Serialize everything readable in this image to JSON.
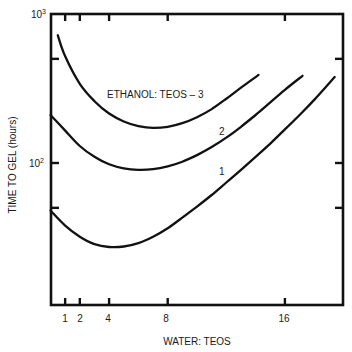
{
  "chart_data": {
    "type": "line",
    "title": "",
    "xlabel": "WATER: TEOS",
    "ylabel": "TIME TO GEL (hours)",
    "xscale": "linear",
    "yscale": "log",
    "xlim": [
      0,
      20
    ],
    "ylim": [
      11,
      1000
    ],
    "x_ticks": [
      1,
      2,
      4,
      8,
      16
    ],
    "x_tick_labels": [
      "1",
      "2",
      "4",
      "8",
      "16"
    ],
    "y_ticks": [
      1000,
      500,
      100,
      50
    ],
    "y_tick_labels": [
      {
        "value": 1000,
        "base": "10",
        "exp": "3"
      },
      {
        "value": 100,
        "base": "10",
        "exp": "2"
      }
    ],
    "grid": false,
    "legend": "inline curve labels",
    "series": [
      {
        "name": "ETHANOL: TEOS – 3",
        "label": "ETHANOL: TEOS – 3",
        "x": [
          0.5,
          1,
          2,
          3,
          4,
          5,
          6,
          7,
          8,
          9,
          10,
          11,
          12,
          13,
          14.2
        ],
        "y": [
          720,
          520,
          340,
          260,
          215,
          190,
          177,
          172,
          175,
          185,
          203,
          230,
          270,
          320,
          390
        ]
      },
      {
        "name": "2",
        "label": "2",
        "x": [
          0,
          1,
          2,
          3,
          4,
          5,
          6,
          7,
          8,
          9,
          10,
          11,
          12,
          13,
          14,
          15,
          16,
          17.2
        ],
        "y": [
          210,
          165,
          130,
          110,
          98,
          92,
          90,
          91,
          95,
          102,
          113,
          128,
          148,
          175,
          210,
          255,
          310,
          385
        ]
      },
      {
        "name": "1",
        "label": "1",
        "x": [
          0,
          1,
          2,
          3,
          4,
          5,
          6,
          7,
          8,
          9,
          10,
          11,
          12,
          13,
          14,
          15,
          16,
          17,
          18,
          19.4
        ],
        "y": [
          48,
          38,
          32,
          28.5,
          27.3,
          27.5,
          29,
          32,
          36.5,
          43,
          51,
          61,
          74,
          90,
          110,
          135,
          168,
          210,
          265,
          378
        ]
      }
    ],
    "annotations": [
      {
        "text": "ETHANOL: TEOS – 3",
        "x": 3.9,
        "y": 300
      },
      {
        "text": "2",
        "x": 11.7,
        "y": 150
      },
      {
        "text": "1",
        "x": 11.7,
        "y": 80
      }
    ]
  }
}
